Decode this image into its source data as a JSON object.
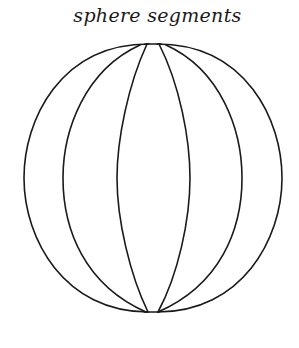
{
  "figure": {
    "title": "sphere segments",
    "stroke_color": "#1a1a1a",
    "background": "#ffffff"
  },
  "sphere": {
    "center_x": 153,
    "top_y": 44,
    "bottom_y": 312,
    "meridian_half_widths": [
      129,
      90,
      35
    ],
    "meridian_count": 6
  }
}
